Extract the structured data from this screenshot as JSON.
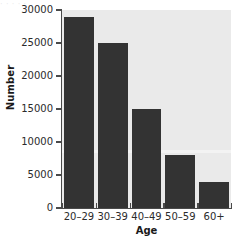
{
  "chart_data": {
    "type": "bar",
    "title": "",
    "subtitle": "",
    "xlabel": "Age",
    "ylabel": "Number",
    "categories": [
      "20–29",
      "30–39",
      "40–49",
      "50–59",
      "60+"
    ],
    "values": [
      29000,
      25000,
      15000,
      8000,
      4000
    ],
    "ylim": [
      0,
      30000
    ],
    "yticks": [
      0,
      5000,
      10000,
      15000,
      20000,
      25000,
      30000
    ],
    "ytick_labels": [
      "0",
      "5000",
      "10000",
      "15000",
      "20000",
      "25000",
      "30000"
    ],
    "grid": false,
    "legend": null,
    "bar_color": "#333333",
    "panel_color": "#eaeaea",
    "axis_color": "#4a4a4a",
    "annotations": []
  },
  "artifacts": {
    "top_text": "· ·   ·     ·        ·"
  }
}
